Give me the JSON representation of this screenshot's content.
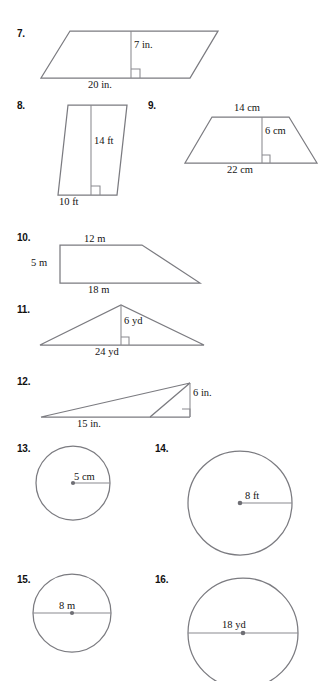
{
  "worksheet": {
    "type": "geometry-area-practice",
    "background": "#ffffff",
    "line_color": "#7b7b80",
    "text_color": "#141414"
  },
  "problems": [
    {
      "number": "7.",
      "shape": "parallelogram",
      "labels": {
        "height": "7 in.",
        "base": "20 in."
      },
      "marks": [
        "right-angle"
      ]
    },
    {
      "number": "8.",
      "shape": "parallelogram",
      "labels": {
        "height": "14 ft",
        "base": "10 ft"
      },
      "marks": [
        "right-angle"
      ]
    },
    {
      "number": "9.",
      "shape": "trapezoid",
      "labels": {
        "top_base": "14 cm",
        "height": "6 cm",
        "bottom_base": "22 cm"
      },
      "marks": [
        "right-angle"
      ]
    },
    {
      "number": "10.",
      "shape": "right-trapezoid",
      "labels": {
        "top_base": "12 m",
        "height": "5 m",
        "bottom_base": "18 m"
      },
      "marks": []
    },
    {
      "number": "11.",
      "shape": "triangle",
      "labels": {
        "height": "6 yd",
        "base": "24 yd"
      },
      "marks": [
        "right-angle"
      ]
    },
    {
      "number": "12.",
      "shape": "obtuse-triangle",
      "labels": {
        "height": "6 in.",
        "base": "15 in."
      },
      "marks": [
        "right-angle"
      ]
    },
    {
      "number": "13.",
      "shape": "circle",
      "labels": {
        "radius": "5 cm"
      },
      "marks": [
        "center-dot",
        "radius-segment"
      ]
    },
    {
      "number": "14.",
      "shape": "circle",
      "labels": {
        "radius": "8 ft"
      },
      "marks": [
        "center-dot",
        "radius-segment"
      ]
    },
    {
      "number": "15.",
      "shape": "circle",
      "labels": {
        "diameter": "8 m"
      },
      "marks": [
        "center-dot",
        "diameter-segment"
      ]
    },
    {
      "number": "16.",
      "shape": "circle",
      "labels": {
        "diameter": "18 yd"
      },
      "marks": [
        "center-dot",
        "diameter-segment"
      ]
    }
  ]
}
